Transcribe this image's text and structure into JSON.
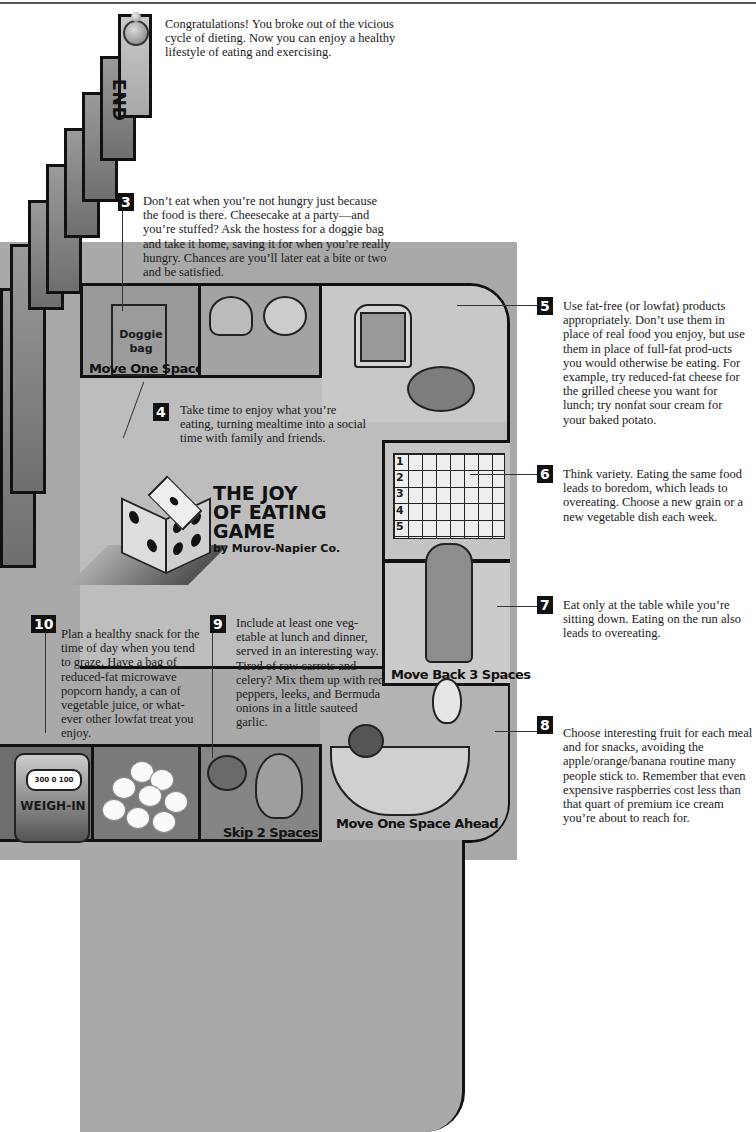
{
  "game": {
    "title_line1": "THE JOY",
    "title_line2": "OF EATING",
    "title_line3": "GAME",
    "byline": "by Murov-Napier Co."
  },
  "end_space": {
    "label": "END"
  },
  "end_text": "Congratulations! You broke out of the vicious cycle of dieting. Now you can enjoy a healthy lifestyle of eating and exercising.",
  "tips": [
    {
      "number": "3",
      "text": "Don’t eat when you’re not hungry just because the food is there. Cheesecake at a party—and you’re stuffed? Ask the hostess for a doggie bag and take it home, saving it for when you’re really hungry. Chances are you’ll later eat a bite or two and be satisfied."
    },
    {
      "number": "4",
      "text": "Take time to enjoy what you’re eating, turning mealtime into a social time with family and friends."
    },
    {
      "number": "5",
      "text": "Use fat-free (or lowfat) products appropriately. Don’t use them in place of real food you enjoy, but use them in place of full-fat prod-ucts you would otherwise be eating. For example, try reduced-fat cheese for the grilled cheese you want for lunch; try nonfat sour cream for your baked potato."
    },
    {
      "number": "6",
      "text": "Think variety. Eating the same food leads to boredom, which leads to overeating. Choose a new grain or a new vegetable dish each week."
    },
    {
      "number": "7",
      "text": "Eat only at the table while you’re sitting down. Eating on the run also leads to overeating."
    },
    {
      "number": "8",
      "text": "Choose interesting fruit for each meal and for snacks, avoiding the apple/orange/banana routine many people stick to. Remember that even expensive raspberries cost less than that quart of premium ice cream you’re about to reach for."
    },
    {
      "number": "9",
      "text": "Include at least one veg-etable at lunch and dinner, served in an interesting way. Tired of raw carrots and celery? Mix them up with red peppers, leeks, and Bermuda onions in a little sauteed garlic."
    },
    {
      "number": "10",
      "text": "Plan a healthy snack for the time of day when you tend to graze. Have a bag of reduced-fat microwave popcorn handy, a can of vegetable juice, or what-ever other lowfat treat you enjoy."
    }
  ],
  "spaces": {
    "doggie_bag": {
      "bag_text": "Doggie bag",
      "label": "Move One Space"
    },
    "runner": {
      "label": "Move Back 3 Spaces"
    },
    "fruit": {
      "label": "Move One Space Ahead"
    },
    "vegetables": {
      "label": "Skip 2 Spaces"
    },
    "weigh_in": {
      "dial": "300 0 100",
      "label": "WEIGH-IN"
    }
  },
  "grid_rows": [
    "1",
    "2",
    "3",
    "4",
    "5"
  ],
  "colors": {
    "board_gray": "#a9a9a9",
    "track_gray": "#bdbdbd",
    "outline": "#111111",
    "badge_bg": "#111111",
    "badge_text": "#ffffff"
  }
}
